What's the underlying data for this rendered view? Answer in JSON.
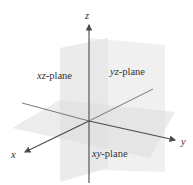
{
  "diagram": {
    "axes": {
      "x": "x",
      "y": "y",
      "z": "z"
    },
    "planes": {
      "xz": {
        "var": "xz",
        "suffix": "-plane"
      },
      "yz": {
        "var": "yz",
        "suffix": "-plane"
      },
      "xy": {
        "var": "xy",
        "suffix": "-plane"
      }
    },
    "colors": {
      "axis": "#4a4a4a",
      "plane": "#d9d9d9",
      "text": "#333333"
    }
  }
}
